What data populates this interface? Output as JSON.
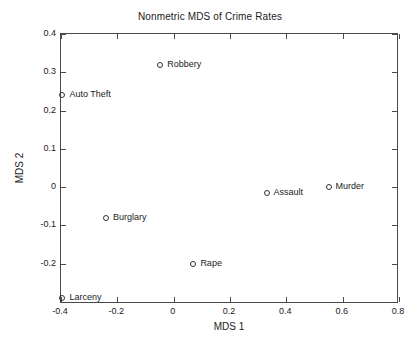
{
  "chart_data": {
    "type": "scatter",
    "title": "Nonmetric MDS of Crime Rates",
    "xlabel": "MDS 1",
    "ylabel": "MDS 2",
    "xlim": [
      -0.4,
      0.8
    ],
    "ylim": [
      -0.305,
      0.4
    ],
    "xticks": [
      -0.4,
      -0.2,
      0,
      0.2,
      0.4,
      0.6,
      0.8
    ],
    "xticklabels": [
      "-0.4",
      "-0.2",
      "0",
      "0.2",
      "0.4",
      "0.6",
      "0.8"
    ],
    "yticks": [
      0.4,
      0.3,
      0.2,
      0.1,
      0,
      -0.1,
      -0.2
    ],
    "yticklabels": [
      "0.4",
      "0.3",
      "0.2",
      "0.1",
      "0",
      "-0.1",
      "-0.2"
    ],
    "grid": false,
    "legend": null,
    "marker": "open-circle",
    "marker_color": "#333333",
    "points": [
      {
        "label": "Robbery",
        "x": -0.048,
        "y": 0.318
      },
      {
        "label": "Auto Theft",
        "x": -0.395,
        "y": 0.24
      },
      {
        "label": "Murder",
        "x": 0.55,
        "y": 0.0
      },
      {
        "label": "Assault",
        "x": 0.33,
        "y": -0.016
      },
      {
        "label": "Burglary",
        "x": -0.24,
        "y": -0.08
      },
      {
        "label": "Rape",
        "x": 0.07,
        "y": -0.2
      },
      {
        "label": "Larceny",
        "x": -0.395,
        "y": -0.29
      }
    ]
  }
}
